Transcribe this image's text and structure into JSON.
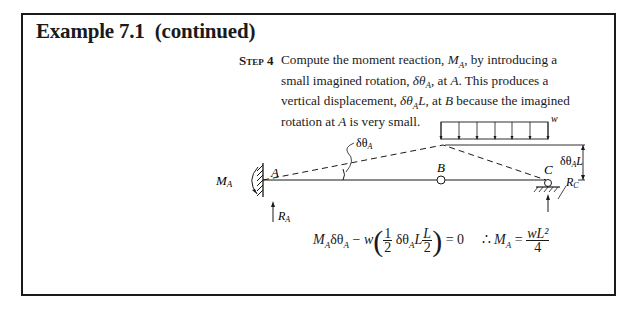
{
  "title": "Example 7.1  (continued)",
  "step": {
    "label": "Step 4",
    "text_parts": [
      "Compute the moment reaction, ",
      "M",
      "A",
      ", by introducing a small imagined rotation, ",
      "δθ",
      "A",
      ", at ",
      "A",
      ". This produces a vertical displacement, ",
      "δθ",
      "A",
      "L",
      ", at ",
      "B",
      " because the imagined rotation at ",
      "A",
      " is very small."
    ]
  },
  "diagram": {
    "labels": {
      "moment_reaction": "M",
      "moment_reaction_sub": "A",
      "point_a": "A",
      "point_b": "B",
      "point_c": "C",
      "rotation": "δθ",
      "rotation_sub": "A",
      "load": "w",
      "displacement": "δθ",
      "displacement_sub": "A",
      "displacement_suffix": "L",
      "reaction_a": "R",
      "reaction_a_sub": "A",
      "reaction_c": "R",
      "reaction_c_sub": "C"
    },
    "load_arrow_count": 7
  },
  "equation": {
    "lhs_m": "M",
    "lhs_m_sub": "A",
    "dtheta": "δθ",
    "dtheta_sub": "A",
    "minus": " − ",
    "w": "w",
    "half_num": "1",
    "half_den": "2",
    "dtheta2": "δθ",
    "dtheta2_sub": "A",
    "L": "L",
    "l_num": "L",
    "l_den": "2",
    "equals_zero": " = 0",
    "therefore": "∴ ",
    "rhs_m": "M",
    "rhs_m_sub": "A",
    "equals": " = ",
    "result_num": "wL²",
    "result_den": "4"
  }
}
